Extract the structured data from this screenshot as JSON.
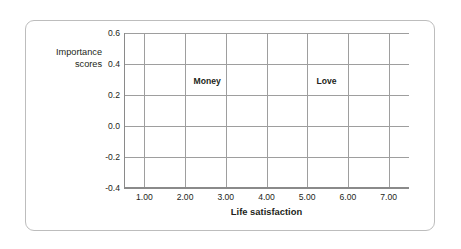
{
  "figure": {
    "background_color": "#ffffff",
    "frame_color": "#bdbdbd"
  },
  "axes": {
    "y_title": "Importance\nscores",
    "x_title": "Life satisfaction",
    "y_ticks": [
      "0.6",
      "0.4",
      "0.2",
      "0.0",
      "-0.2",
      "-0.4"
    ],
    "x_ticks": [
      "1.00",
      "2.00",
      "3.00",
      "4.00",
      "5.00",
      "6.00",
      "7.00"
    ],
    "grid_color": "#9e9e9e",
    "axis_color": "#8a8a8a"
  },
  "series_labels": {
    "money": "Money",
    "love": "Love"
  },
  "chart_data": {
    "type": "line",
    "title": "",
    "xlabel": "Life satisfaction",
    "ylabel": "Importance scores",
    "x": [
      1.0,
      2.0,
      3.0,
      4.0,
      5.0,
      6.0,
      7.0
    ],
    "xlim": [
      0.5,
      7.5
    ],
    "ylim": [
      -0.4,
      0.6
    ],
    "ytick_values": [
      0.6,
      0.4,
      0.2,
      0.0,
      -0.2,
      -0.4
    ],
    "xtick_values": [
      1.0,
      2.0,
      3.0,
      4.0,
      5.0,
      6.0,
      7.0
    ],
    "grid": true,
    "legend": "inline-labels",
    "series": [
      {
        "name": "Money",
        "color": "#c0c0c0",
        "values": [
          0.38,
          0.26,
          0.13,
          -0.01,
          -0.13,
          -0.15,
          -0.29
        ]
      },
      {
        "name": "Love",
        "color": "#9a9a9a",
        "values": [
          -0.17,
          -0.2,
          -0.15,
          -0.1,
          0.07,
          0.21,
          0.38
        ]
      }
    ],
    "annotations": [
      {
        "text": "Money",
        "x": 2.6,
        "y": 0.285
      },
      {
        "text": "Love",
        "x": 5.55,
        "y": 0.285
      }
    ]
  }
}
